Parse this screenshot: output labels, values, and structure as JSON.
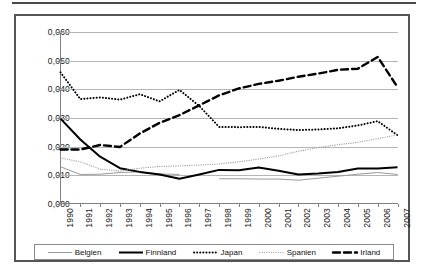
{
  "figure": {
    "type": "line-chart",
    "decimal_separator": ","
  },
  "legend": {
    "items": [
      {
        "label": "Belgien",
        "key": "belgien",
        "style": "thin-solid",
        "color": "#9a9a9a"
      },
      {
        "label": "Finnland",
        "key": "finnland",
        "style": "thick-solid",
        "color": "#000000"
      },
      {
        "label": "Japan",
        "key": "japan",
        "style": "thick-dotted",
        "color": "#000000"
      },
      {
        "label": "Spanien",
        "key": "spanien",
        "style": "thin-dotted",
        "color": "#9a9a9a"
      },
      {
        "label": "Irland",
        "key": "irland",
        "style": "thick-dashed",
        "color": "#000000"
      }
    ]
  },
  "chart_data": {
    "type": "line",
    "title": "",
    "subtitle": "",
    "xlabel": "",
    "ylabel": "",
    "grid": true,
    "legend_position": "bottom",
    "xlim": [
      1990,
      2007
    ],
    "ylim": [
      0.0,
      0.06
    ],
    "ytick_labels": [
      "0,060",
      "0,050",
      "0,040",
      "0,030",
      "0,020",
      "0,010",
      "0,000"
    ],
    "ytick_values": [
      0.06,
      0.05,
      0.04,
      0.03,
      0.02,
      0.01,
      0.0
    ],
    "categories": [
      "1990",
      "1991",
      "1992",
      "1993",
      "1994",
      "1995",
      "1996",
      "1997",
      "1998",
      "1999",
      "2000",
      "2001",
      "2002",
      "2003",
      "2004",
      "2005",
      "2006",
      "2007"
    ],
    "x": [
      1990,
      1991,
      1992,
      1993,
      1994,
      1995,
      1996,
      1997,
      1998,
      1999,
      2000,
      2001,
      2002,
      2003,
      2004,
      2005,
      2006,
      2007
    ],
    "series": [
      {
        "name": "Belgien",
        "color": "#9a9a9a",
        "style": "thin-solid",
        "values": [
          0.013,
          0.0103,
          0.0104,
          0.011,
          0.0112,
          0.0105,
          0.0103,
          null,
          0.0088,
          0.0088,
          0.0087,
          0.0087,
          0.0083,
          0.009,
          0.0097,
          0.0104,
          0.011,
          0.0103
        ]
      },
      {
        "name": "Finnland",
        "color": "#000000",
        "style": "thick-solid",
        "values": [
          0.0298,
          0.0225,
          0.0165,
          0.0125,
          0.0112,
          0.0103,
          0.0088,
          0.0103,
          0.0119,
          0.0118,
          0.0127,
          0.0116,
          0.0103,
          0.0106,
          0.0112,
          0.0124,
          0.0124,
          0.0128
        ]
      },
      {
        "name": "Japan",
        "color": "#000000",
        "style": "thick-dotted",
        "values": [
          0.0459,
          0.0366,
          0.0372,
          0.0364,
          0.0383,
          0.0358,
          0.0398,
          0.0342,
          0.0269,
          0.0268,
          0.0269,
          0.0262,
          0.0258,
          0.026,
          0.0264,
          0.0274,
          0.0289,
          0.024
        ]
      },
      {
        "name": "Spanien",
        "color": "#9a9a9a",
        "style": "thin-dotted",
        "values": [
          0.0161,
          0.0147,
          0.0122,
          0.0115,
          0.0125,
          0.0131,
          0.0133,
          0.0136,
          0.014,
          0.0147,
          0.0157,
          0.0168,
          0.0184,
          0.0197,
          0.0207,
          0.0215,
          0.0228,
          0.0241
        ]
      },
      {
        "name": "Irland",
        "color": "#000000",
        "style": "thick-dashed",
        "values": [
          0.019,
          0.019,
          0.0206,
          0.0199,
          0.0246,
          0.0283,
          0.031,
          0.0344,
          0.0379,
          0.0403,
          0.0419,
          0.043,
          0.0444,
          0.0455,
          0.0468,
          0.0472,
          0.0513,
          0.0408
        ]
      }
    ]
  }
}
